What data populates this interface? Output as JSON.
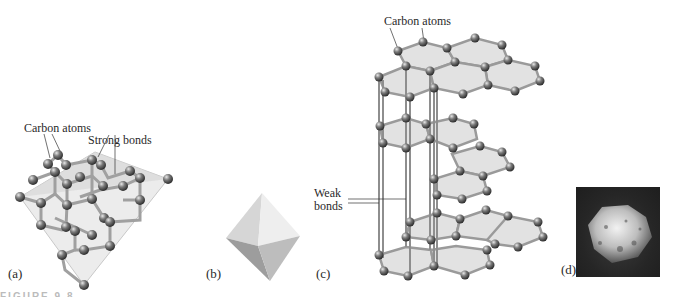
{
  "figure": {
    "panels": [
      {
        "id": "a",
        "label": "(a)",
        "subject": "diamond crystal lattice",
        "annotations": [
          "Carbon atoms",
          "Strong bonds"
        ]
      },
      {
        "id": "b",
        "label": "(b)",
        "subject": "octahedral crystal shape"
      },
      {
        "id": "c",
        "label": "(c)",
        "subject": "graphite layered structure",
        "annotations": [
          "Carbon atoms",
          "Weak bonds"
        ]
      },
      {
        "id": "d",
        "label": "(d)",
        "subject": "photo of rough crystal"
      }
    ],
    "annotations": {
      "a_carbon_atoms": "Carbon atoms",
      "a_strong_bonds": "Strong bonds",
      "c_carbon_atoms": "Carbon atoms",
      "c_weak_bonds_line1": "Weak",
      "c_weak_bonds_line2": "bonds"
    },
    "caption_fragment": "FIGURE 9.8",
    "colors": {
      "atom": "#5a5a5a",
      "bond": "#9a9a9a",
      "plane": "#e4e4e4",
      "background": "#ffffff"
    }
  }
}
